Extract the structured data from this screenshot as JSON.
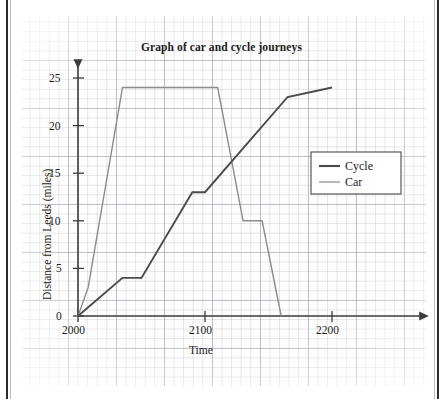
{
  "chart_data": {
    "type": "line",
    "title": "Graph of car and cycle journeys",
    "xlabel": "Time",
    "ylabel": "Distance from Leeds (miles)",
    "xlim": [
      2000,
      2240
    ],
    "ylim": [
      0,
      26
    ],
    "xticks": [
      "2000",
      "2100",
      "2200"
    ],
    "xtick_values": [
      2000,
      2100,
      2200
    ],
    "yticks": [
      "0",
      "5",
      "10",
      "15",
      "20",
      "25"
    ],
    "ytick_values": [
      0,
      5,
      10,
      15,
      20,
      25
    ],
    "grid": "graph-paper",
    "legend_position": "right-middle",
    "series": [
      {
        "name": "Cycle",
        "color": "#4a4a4a",
        "points": [
          {
            "x": 2000,
            "y": 0
          },
          {
            "x": 2035,
            "y": 4
          },
          {
            "x": 2050,
            "y": 4
          },
          {
            "x": 2090,
            "y": 13
          },
          {
            "x": 2100,
            "y": 13
          },
          {
            "x": 2165,
            "y": 23
          },
          {
            "x": 2200,
            "y": 24
          }
        ]
      },
      {
        "name": "Car",
        "color": "#8c8c8c",
        "points": [
          {
            "x": 2000,
            "y": 0
          },
          {
            "x": 2008,
            "y": 3
          },
          {
            "x": 2035,
            "y": 24
          },
          {
            "x": 2110,
            "y": 24
          },
          {
            "x": 2130,
            "y": 10
          },
          {
            "x": 2145,
            "y": 10
          },
          {
            "x": 2160,
            "y": 0
          }
        ]
      }
    ]
  },
  "legend": {
    "items": [
      {
        "label": "Cycle",
        "color": "#4a4a4a"
      },
      {
        "label": "Car",
        "color": "#9a9a9a"
      }
    ]
  },
  "colors": {
    "cycle": "#4a4a4a",
    "car": "#9a9a9a",
    "axis": "#3a3a3a",
    "text": "#1c1c1c",
    "grid_major": "#9698a0",
    "grid_minor": "#afafb9",
    "paper": "#fdfdfd",
    "page_edge": "#2b2b2b"
  }
}
